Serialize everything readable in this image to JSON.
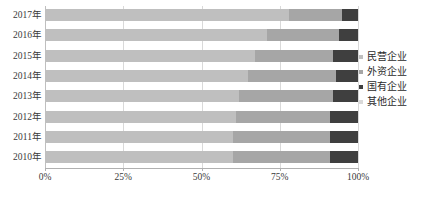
{
  "chart_data": {
    "type": "bar",
    "orientation": "horizontal",
    "stacked": true,
    "normalized": true,
    "title": "",
    "subtitle": "",
    "xlabel": "",
    "ylabel": "",
    "xlim": [
      0,
      100
    ],
    "grid": true,
    "legend_position": "right",
    "categories": [
      "2017年",
      "2016年",
      "2015年",
      "2014年",
      "2013年",
      "2012年",
      "2011年",
      "2010年"
    ],
    "xticks": [
      0,
      25,
      50,
      75,
      100
    ],
    "xtick_labels": [
      "0%",
      "25%",
      "50%",
      "75%",
      "100%"
    ],
    "series": [
      {
        "name": "民营企业",
        "color": "#bfbfbf",
        "values": [
          78,
          71,
          67,
          65,
          62,
          61,
          60,
          60
        ]
      },
      {
        "name": "外资企业",
        "color": "#a6a6a6",
        "values": [
          17,
          23,
          25,
          28,
          30,
          30,
          31,
          31
        ]
      },
      {
        "name": "国有企业",
        "color": "#3f3f3f",
        "values": [
          5,
          6,
          8,
          7,
          8,
          9,
          9,
          9
        ]
      },
      {
        "name": "其他企业",
        "color": "#d9d9d9",
        "values": [
          0,
          0,
          0,
          0,
          0,
          0,
          0,
          0
        ]
      }
    ]
  },
  "legend": {
    "items": [
      {
        "label": "民营企业",
        "color": "#bfbfbf"
      },
      {
        "label": "外资企业",
        "color": "#a6a6a6"
      },
      {
        "label": "国有企业",
        "color": "#3f3f3f"
      },
      {
        "label": "其他企业",
        "color": "#d9d9d9"
      }
    ]
  }
}
